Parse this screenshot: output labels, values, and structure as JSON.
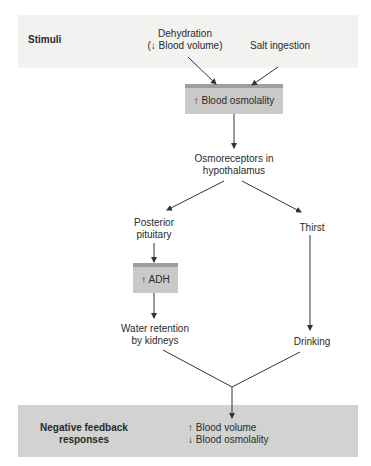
{
  "diagram": {
    "stimuli_band": {
      "label": "Stimuli"
    },
    "stimuli": [
      {
        "line1": "Dehydration",
        "line2": "(↓ Blood volume)"
      },
      {
        "line1": "Salt ingestion"
      }
    ],
    "osmolality_box": {
      "label": "↑ Blood osmolality"
    },
    "osmoreceptors": {
      "line1": "Osmoreceptors in",
      "line2": "hypothalamus"
    },
    "left_branch": {
      "node1": {
        "line1": "Posterior",
        "line2": "pituitary"
      },
      "adh_box": {
        "label": "↑ ADH"
      },
      "node2": {
        "line1": "Water retention",
        "line2": "by kidneys"
      }
    },
    "right_branch": {
      "node1": {
        "line1": "Thirst"
      },
      "node2": {
        "line1": "Drinking"
      }
    },
    "response_band": {
      "label_line1": "Negative feedback",
      "label_line2": "responses",
      "result_line1": "↑ Blood volume",
      "result_line2": "↓ Blood osmolality"
    },
    "colors": {
      "top_band": "#f2f2f0",
      "bottom_band": "#d2d2d0",
      "box": "#c9c9c7",
      "box_top": "#9e9e9c",
      "line": "#333333"
    }
  }
}
